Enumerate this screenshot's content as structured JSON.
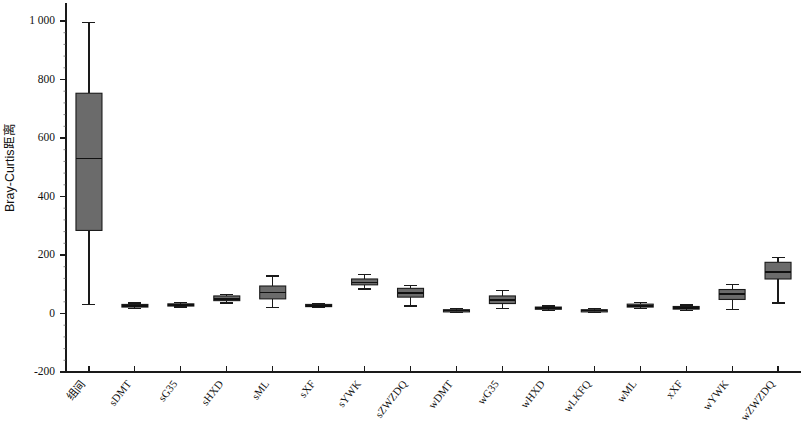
{
  "chart_data": {
    "type": "box",
    "title": "",
    "xlabel": "",
    "ylabel": "Bray-Curtis距离",
    "ylim": [
      -200,
      1060
    ],
    "yticks": [
      -200,
      0,
      200,
      400,
      600,
      800,
      1000
    ],
    "ytick_labels": [
      "-200",
      "0",
      "200",
      "400",
      "600",
      "800",
      "1 000"
    ],
    "grid": false,
    "legend": "none",
    "box_fill_color": "#6b6b6b",
    "box_line_color": "#1a1a1a",
    "categories": [
      "组间",
      "sDMT",
      "sG35",
      "sHXD",
      "sML",
      "sXF",
      "sYWK",
      "sZWZDQ",
      "wDMT",
      "wG35",
      "wHXD",
      "wLKFQ",
      "wML",
      "xXF",
      "wYWK",
      "wZWZDQ"
    ],
    "boxes": [
      {
        "label": "组间",
        "whisker_low": 30,
        "q1": 284,
        "median": 530,
        "q3": 753,
        "whisker_high": 995
      },
      {
        "label": "sDMT",
        "whisker_low": 18,
        "q1": 22,
        "median": 26,
        "q3": 31,
        "whisker_high": 36
      },
      {
        "label": "sG35",
        "whisker_low": 22,
        "q1": 26,
        "median": 29,
        "q3": 33,
        "whisker_high": 37
      },
      {
        "label": "sHXD",
        "whisker_low": 36,
        "q1": 44,
        "median": 50,
        "q3": 60,
        "whisker_high": 66
      },
      {
        "label": "sML",
        "whisker_low": 20,
        "q1": 50,
        "median": 72,
        "q3": 94,
        "whisker_high": 128
      },
      {
        "label": "sXF",
        "whisker_low": 20,
        "q1": 24,
        "median": 27,
        "q3": 31,
        "whisker_high": 34
      },
      {
        "label": "sYWK",
        "whisker_low": 84,
        "q1": 98,
        "median": 106,
        "q3": 118,
        "whisker_high": 133
      },
      {
        "label": "sZWZDQ",
        "whisker_low": 26,
        "q1": 56,
        "median": 70,
        "q3": 86,
        "whisker_high": 96
      },
      {
        "label": "wDMT",
        "whisker_low": 4,
        "q1": 7,
        "median": 10,
        "q3": 13,
        "whisker_high": 17
      },
      {
        "label": "wG35",
        "whisker_low": 18,
        "q1": 34,
        "median": 46,
        "q3": 60,
        "whisker_high": 78
      },
      {
        "label": "wHXD",
        "whisker_low": 11,
        "q1": 15,
        "median": 18,
        "q3": 22,
        "whisker_high": 26
      },
      {
        "label": "wLKFQ",
        "whisker_low": 4,
        "q1": 7,
        "median": 10,
        "q3": 13,
        "whisker_high": 17
      },
      {
        "label": "wML",
        "whisker_low": 18,
        "q1": 22,
        "median": 27,
        "q3": 32,
        "whisker_high": 37
      },
      {
        "label": "xXF",
        "whisker_low": 11,
        "q1": 15,
        "median": 19,
        "q3": 24,
        "whisker_high": 29
      },
      {
        "label": "wYWK",
        "whisker_low": 14,
        "q1": 48,
        "median": 66,
        "q3": 82,
        "whisker_high": 100
      },
      {
        "label": "wZWZDQ",
        "whisker_low": 36,
        "q1": 118,
        "median": 143,
        "q3": 175,
        "whisker_high": 192
      }
    ]
  }
}
